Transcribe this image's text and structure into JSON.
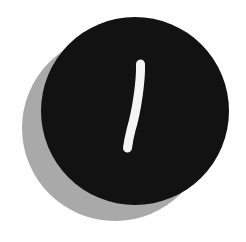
{
  "badge": {
    "label": "1",
    "colors": {
      "background": "#ffffff",
      "disc": "#121212",
      "shadow": "#a9a9a9",
      "numeral": "#f4f4f4"
    },
    "disc": {
      "cx": 135,
      "cy": 111,
      "r": 94
    },
    "shadow": {
      "cx": 115,
      "cy": 128,
      "r": 93
    }
  }
}
